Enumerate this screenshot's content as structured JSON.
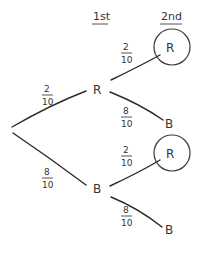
{
  "diagram": {
    "type": "probability-tree",
    "headers": {
      "first": "1st",
      "second": "2nd"
    },
    "first_draw": {
      "red": {
        "label": "R",
        "probability": {
          "num": "2",
          "den": "10"
        }
      },
      "blue": {
        "label": "B",
        "probability": {
          "num": "8",
          "den": "10"
        }
      }
    },
    "second_draw": {
      "after_red": {
        "red": {
          "label": "R",
          "circled": true,
          "probability": {
            "num": "2",
            "den": "10"
          }
        },
        "blue": {
          "label": "B",
          "circled": false,
          "probability": {
            "num": "8",
            "den": "10"
          }
        }
      },
      "after_blue": {
        "red": {
          "label": "R",
          "circled": true,
          "probability": {
            "num": "2",
            "den": "10"
          }
        },
        "blue": {
          "label": "B",
          "circled": false,
          "probability": {
            "num": "8",
            "den": "10"
          }
        }
      }
    },
    "colors": {
      "ink": "#333333",
      "background": "#ffffff"
    }
  }
}
